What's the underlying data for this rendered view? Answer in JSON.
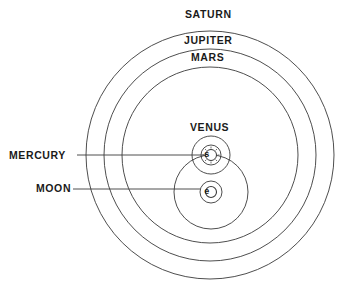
{
  "diagram": {
    "labels": {
      "saturn": "SATURN",
      "jupiter": "JUPITER",
      "mars": "MARS",
      "venus": "VENUS",
      "mercury": "MERCURY",
      "moon": "MOON"
    },
    "symbols": {
      "sun": "s",
      "earth": "e"
    },
    "colors": {
      "stroke": "#3a3a3a",
      "text": "#1a1a1a",
      "background": "#ffffff"
    }
  }
}
